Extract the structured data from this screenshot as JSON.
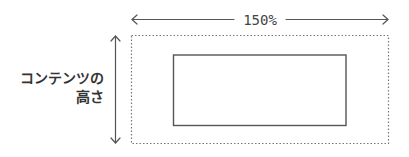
{
  "diagram": {
    "width_annotation": {
      "label": "150%",
      "direction": "horizontal",
      "arrowheads": "both"
    },
    "height_annotation": {
      "label_line1": "コンテンツの",
      "label_line2": "高さ",
      "direction": "vertical",
      "arrowheads": "both"
    },
    "outer_box": {
      "style": "dotted",
      "represents": "expanded area (150% width)"
    },
    "inner_box": {
      "style": "solid",
      "represents": "content"
    },
    "colors": {
      "stroke": "#555555",
      "dotted_stroke": "#777777",
      "text": "#333333",
      "background": "#ffffff"
    }
  }
}
